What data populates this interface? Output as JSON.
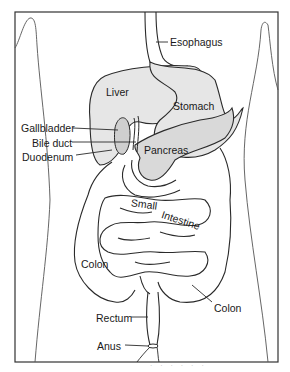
{
  "figure": {
    "colors": {
      "frame": "#333333",
      "outline": "#2a2a2a",
      "organ_fill": "#e6e6e6",
      "background": "#ffffff",
      "label_text": "#1a1a1a"
    }
  },
  "labels": {
    "esophagus": "Esophagus",
    "liver": "Liver",
    "stomach": "Stomach",
    "gallbladder": "Gallbladder",
    "bile_duct": "Bile duct",
    "pancreas": "Pancreas",
    "duodenum": "Duodenum",
    "small_intestine_1": "Small",
    "small_intestine_2": "Intestine",
    "colon_left": "Colon",
    "colon_right": "Colon",
    "rectum": "Rectum",
    "anus": "Anus"
  },
  "caption": "· · ·  ·  · ·"
}
